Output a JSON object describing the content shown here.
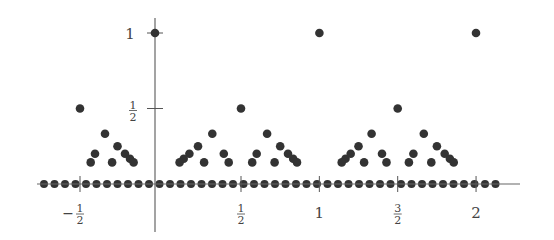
{
  "chart_data": {
    "type": "scatter",
    "title": "",
    "xlabel": "",
    "ylabel": "",
    "xlim": [
      -0.75,
      2.3
    ],
    "ylim": [
      0,
      1
    ],
    "grid": false,
    "legend": null,
    "x_ticks": [
      {
        "value": -0.5,
        "label_num": "1",
        "label_den": "2",
        "sign": "−"
      },
      {
        "value": 0.5,
        "label_num": "1",
        "label_den": "2",
        "sign": ""
      },
      {
        "value": 1,
        "label": "1"
      },
      {
        "value": 1.5,
        "label_num": "3",
        "label_den": "2",
        "sign": ""
      },
      {
        "value": 2,
        "label": "2"
      }
    ],
    "y_ticks": [
      {
        "value": 0.5,
        "label_num": "1",
        "label_den": "2"
      },
      {
        "value": 1,
        "label": "1"
      }
    ],
    "max_denominator_shown": 7,
    "x_range_points": [
      -0.5,
      2
    ],
    "series": [
      {
        "name": "rational points (x = p/q, y = 1/q)",
        "rule": "q from 1 to 7, p/q in lowest terms, x in [-0.5, 2]"
      },
      {
        "name": "zero points on axis",
        "spacing": 0.0667,
        "x_start": -0.72,
        "x_end": 2.2
      }
    ]
  }
}
